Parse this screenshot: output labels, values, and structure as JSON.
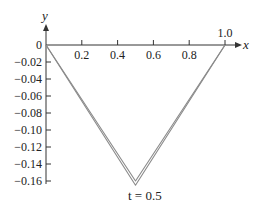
{
  "chart_data": {
    "type": "line",
    "title": "",
    "xlabel": "x",
    "ylabel": "y",
    "caption": "t = 0.5",
    "xlim": [
      0,
      1.0
    ],
    "ylim": [
      -0.16,
      0
    ],
    "x_ticks": [
      0.2,
      0.4,
      0.6,
      0.8,
      1.0
    ],
    "x_tick_labels": [
      "0.2",
      "0.4",
      "0.6",
      "0.8",
      "1.0"
    ],
    "y_ticks": [
      0,
      -0.02,
      -0.04,
      -0.06,
      -0.08,
      -0.1,
      -0.12,
      -0.14,
      -0.16
    ],
    "y_tick_labels": [
      "0",
      "−0.02",
      "−0.04",
      "−0.06",
      "−0.08",
      "−0.10",
      "−0.12",
      "−0.14",
      "−0.16"
    ],
    "grid": false,
    "series": [
      {
        "name": "outer",
        "x": [
          0,
          0.5,
          1.0
        ],
        "y": [
          0,
          -0.165,
          0
        ]
      },
      {
        "name": "inner",
        "x": [
          0,
          0.5,
          1.0
        ],
        "y": [
          0,
          -0.16,
          0
        ]
      }
    ],
    "line_color": "#8a8a8a"
  }
}
